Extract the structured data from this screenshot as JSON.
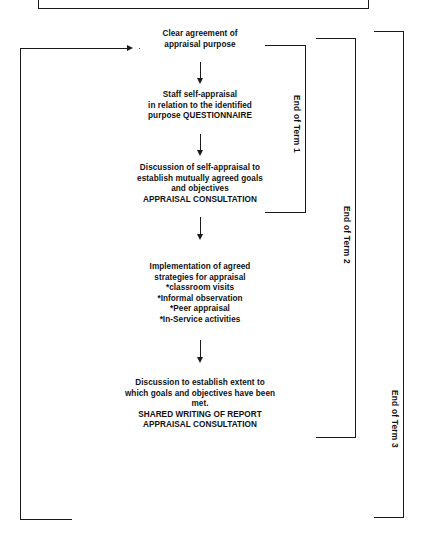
{
  "diagram": {
    "nodes": [
      {
        "id": "clear-agreement",
        "lines": [
          "Clear agreement of",
          "appraisal purpose"
        ]
      },
      {
        "id": "staff-self-appraisal",
        "lines": [
          "Staff self-appraisal",
          "in relation to the identified",
          "purpose QUESTIONNAIRE"
        ]
      },
      {
        "id": "discussion-self-appraisal",
        "lines": [
          "Discussion of self-appraisal to",
          "establish mutually agreed goals",
          "and objectives",
          "APPRAISAL CONSULTATION"
        ]
      },
      {
        "id": "implementation-strategies",
        "lines": [
          "Implementation of agreed",
          "strategies for appraisal",
          "*classroom visits",
          "*Informal observation",
          "*Peer appraisal",
          "*In-Service activities"
        ]
      },
      {
        "id": "discussion-extent",
        "lines": [
          "Discussion to establish extent to",
          "which goals and objectives have been",
          "met.",
          "SHARED WRITING OF REPORT",
          "APPRAISAL CONSULTATION"
        ]
      }
    ],
    "term_brackets": [
      {
        "id": "term-1",
        "label": "End of Term 1"
      },
      {
        "id": "term-2",
        "label": "End of Term 2"
      },
      {
        "id": "term-3",
        "label": "End of Term 3"
      }
    ],
    "colors": {
      "ink": "#1a1a1a",
      "background": "#ffffff"
    }
  }
}
